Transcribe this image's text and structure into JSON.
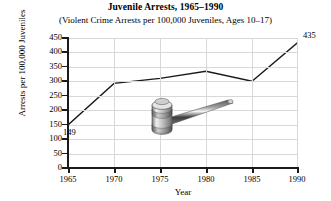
{
  "chart_data": {
    "type": "line",
    "title": "Juvenile Arrests, 1965–1990",
    "subtitle": "(Violent Crime Arrests per 100,000 Juveniles, Ages 10–17)",
    "xlabel": "Year",
    "ylabel": "Arrests per 100,000 Juveniles",
    "x": [
      1965,
      1970,
      1975,
      1980,
      1985,
      1990
    ],
    "values": [
      149,
      293,
      310,
      335,
      300,
      435
    ],
    "xlim": [
      1965,
      1990
    ],
    "ylim": [
      0,
      450
    ],
    "x_ticks": [
      "1965",
      "1970",
      "1975",
      "1980",
      "1985",
      "1990"
    ],
    "y_ticks": [
      "0",
      "50",
      "100",
      "150",
      "200",
      "250",
      "300",
      "350",
      "400",
      "450"
    ],
    "grid": true,
    "legend": "none",
    "line_color": "#1a1a1a",
    "grid_color": "#d8d8d8",
    "data_labels": [
      {
        "point_year": 1965,
        "text": "149"
      },
      {
        "point_year": 1990,
        "text": "435"
      }
    ],
    "decoration": {
      "name": "gavel-illustration",
      "description": "grayscale judge's gavel resting on the plot area"
    }
  }
}
